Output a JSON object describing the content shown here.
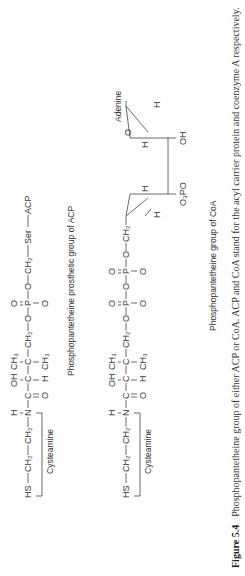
{
  "acp": {
    "chain": [
      "HS",
      "CH₂",
      "CH₂",
      "N",
      "C",
      "CH₂",
      "C",
      "C",
      "CH₂",
      "O",
      "P",
      "O",
      "CH₂",
      "Ser",
      "ACP"
    ],
    "above": {
      "n_h": "H",
      "oh": "OH",
      "ch3": "CH₃"
    },
    "below": {
      "c_o": "O",
      "h": "H",
      "ch3": "CH₃",
      "p_o": "O",
      "p_o_top": "O"
    },
    "bracket_label": "Cysteamine",
    "caption": "Phosphopantetheine prosthetic group of ACP"
  },
  "coa": {
    "chain": [
      "HS",
      "CH₂",
      "CH₂",
      "N",
      "C",
      "CH₂",
      "C",
      "C",
      "CH₂",
      "O",
      "P",
      "O",
      "P",
      "O",
      "CH₂"
    ],
    "above": {
      "n_h": "H",
      "oh": "OH",
      "ch3": "CH₃"
    },
    "ribose": {
      "adenine": "Adenine",
      "ring_o": "O",
      "h1": "H",
      "h2": "H",
      "h3": "H",
      "h4": "H",
      "oh": "OH",
      "o3po": "O₃PO"
    },
    "bracket_label": "Cysteamine",
    "caption": "Phosphopantetheine group of CoA"
  },
  "figure": {
    "label": "Figure 5.4",
    "caption": "Phosphopantetheine group of either ACP or CoA. ACP and CoA stand for the acyl carrier protein and coenzyme A respectively."
  }
}
